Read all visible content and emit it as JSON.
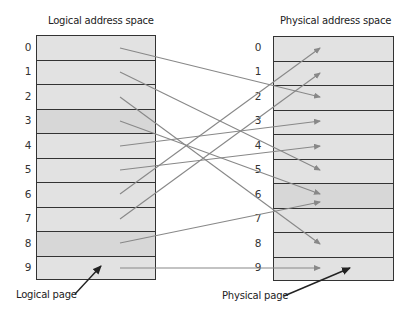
{
  "diagram": {
    "logical": {
      "title": "Logical address space",
      "pages": [
        "0",
        "1",
        "2",
        "3",
        "4",
        "5",
        "6",
        "7",
        "8",
        "9"
      ],
      "shaded_rows": [
        3,
        8
      ]
    },
    "physical": {
      "title": "Physical address space",
      "frames": [
        "0",
        "1",
        "2",
        "3",
        "4",
        "5",
        "6",
        "7",
        "8",
        "9"
      ],
      "shaded_rows": [
        6
      ]
    },
    "mapping": [
      {
        "logical": 0,
        "physical": 2
      },
      {
        "logical": 1,
        "physical": 5
      },
      {
        "logical": 2,
        "physical": 8
      },
      {
        "logical": 3,
        "physical": 6
      },
      {
        "logical": 4,
        "physical": 3
      },
      {
        "logical": 5,
        "physical": 4
      },
      {
        "logical": 6,
        "physical": 0
      },
      {
        "logical": 7,
        "physical": 1
      },
      {
        "logical": 8,
        "physical": 6
      },
      {
        "logical": 9,
        "physical": 9
      }
    ],
    "captions": {
      "logical_page": "Logical page",
      "physical_page": "Physical page"
    },
    "colors": {
      "box_fill": "#e2e2e2",
      "box_fill_shaded": "#d7d7d7",
      "border": "#333333",
      "mapping_line": "#888888",
      "pointer_arrow": "#222222"
    }
  }
}
